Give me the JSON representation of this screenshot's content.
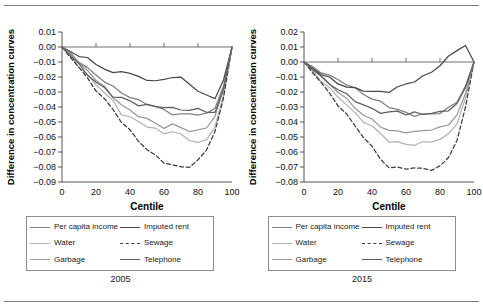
{
  "figure": {
    "rule_color": "#7d7d7d",
    "background": "#ffffff"
  },
  "panels": [
    {
      "year_label": "2005",
      "axis": {
        "xlabel": "Centile",
        "ylabel": "Difference in concentration curves",
        "xticks": [
          "0",
          "20",
          "40",
          "60",
          "80",
          "100"
        ],
        "yticks": [
          "0.01",
          "0.00",
          "−0.01",
          "−0.02",
          "−0.03",
          "−0.04",
          "−0.05",
          "−0.06",
          "−0.07",
          "−0.08",
          "−0.09"
        ]
      },
      "legend": [
        {
          "label": "Per capita income",
          "color": "#7f7f7f",
          "style": "solid"
        },
        {
          "label": "Imputed rent",
          "color": "#4a4a4a",
          "style": "solid"
        },
        {
          "label": "Water",
          "color": "#b3b3b3",
          "style": "solid"
        },
        {
          "label": "Sewage",
          "color": "#3d3d3d",
          "style": "dashed"
        },
        {
          "label": "Garbage",
          "color": "#999999",
          "style": "solid"
        },
        {
          "label": "Telephone",
          "color": "#5e5e5e",
          "style": "solid"
        }
      ]
    },
    {
      "year_label": "2015",
      "axis": {
        "xlabel": "Centile",
        "ylabel": "Difference in concentration curves",
        "xticks": [
          "0",
          "20",
          "40",
          "60",
          "80",
          "100"
        ],
        "yticks": [
          "0.02",
          "0.01",
          "0.00",
          "−0.01",
          "−0.02",
          "−0.03",
          "−0.04",
          "−0.05",
          "−0.06",
          "−0.07",
          "−0.08"
        ]
      },
      "legend": [
        {
          "label": "Per capita income",
          "color": "#7f7f7f",
          "style": "solid"
        },
        {
          "label": "Imputed rent",
          "color": "#4a4a4a",
          "style": "solid"
        },
        {
          "label": "Water",
          "color": "#b3b3b3",
          "style": "solid"
        },
        {
          "label": "Sewage",
          "color": "#3d3d3d",
          "style": "dashed"
        },
        {
          "label": "Garbage",
          "color": "#999999",
          "style": "solid"
        },
        {
          "label": "Telephone",
          "color": "#5e5e5e",
          "style": "solid"
        }
      ]
    }
  ],
  "chart_data": [
    {
      "type": "line",
      "title": "2005",
      "xlabel": "Centile",
      "ylabel": "Difference in concentration curves",
      "xlim": [
        0,
        100
      ],
      "ylim": [
        -0.09,
        0.01
      ],
      "yticks": [
        0.01,
        0.0,
        -0.01,
        -0.02,
        -0.03,
        -0.04,
        -0.05,
        -0.06,
        -0.07,
        -0.08,
        -0.09
      ],
      "xticks": [
        0,
        20,
        40,
        60,
        80,
        100
      ],
      "grid": false,
      "legend_position": "below",
      "x": [
        0,
        5,
        10,
        15,
        20,
        25,
        30,
        35,
        40,
        45,
        50,
        55,
        60,
        65,
        70,
        75,
        80,
        85,
        90,
        95,
        100
      ],
      "series": [
        {
          "name": "Per capita income",
          "color": "#7f7f7f",
          "style": "solid",
          "values": [
            0.0,
            -0.004,
            -0.009,
            -0.014,
            -0.019,
            -0.023,
            -0.027,
            -0.03,
            -0.033,
            -0.036,
            -0.038,
            -0.04,
            -0.042,
            -0.044,
            -0.045,
            -0.045,
            -0.045,
            -0.045,
            -0.04,
            -0.026,
            0.0
          ]
        },
        {
          "name": "Imputed rent",
          "color": "#4a4a4a",
          "style": "solid",
          "values": [
            0.0,
            -0.003,
            -0.006,
            -0.008,
            -0.011,
            -0.014,
            -0.018,
            -0.016,
            -0.018,
            -0.02,
            -0.021,
            -0.023,
            -0.022,
            -0.02,
            -0.021,
            -0.024,
            -0.029,
            -0.033,
            -0.034,
            -0.022,
            0.0
          ]
        },
        {
          "name": "Water",
          "color": "#b3b3b3",
          "style": "solid",
          "values": [
            0.0,
            -0.006,
            -0.013,
            -0.019,
            -0.025,
            -0.031,
            -0.036,
            -0.044,
            -0.047,
            -0.05,
            -0.053,
            -0.055,
            -0.057,
            -0.056,
            -0.059,
            -0.062,
            -0.064,
            -0.062,
            -0.052,
            -0.032,
            0.0
          ]
        },
        {
          "name": "Sewage",
          "color": "#3d3d3d",
          "style": "dashed",
          "values": [
            0.0,
            -0.007,
            -0.014,
            -0.021,
            -0.028,
            -0.035,
            -0.042,
            -0.05,
            -0.056,
            -0.062,
            -0.068,
            -0.073,
            -0.077,
            -0.079,
            -0.08,
            -0.079,
            -0.076,
            -0.069,
            -0.056,
            -0.034,
            0.0
          ]
        },
        {
          "name": "Garbage",
          "color": "#999999",
          "style": "solid",
          "values": [
            0.0,
            -0.005,
            -0.011,
            -0.016,
            -0.022,
            -0.027,
            -0.033,
            -0.038,
            -0.043,
            -0.046,
            -0.048,
            -0.051,
            -0.053,
            -0.052,
            -0.054,
            -0.056,
            -0.056,
            -0.053,
            -0.046,
            -0.028,
            0.0
          ]
        },
        {
          "name": "Telephone",
          "color": "#5e5e5e",
          "style": "solid",
          "values": [
            0.0,
            -0.006,
            -0.012,
            -0.018,
            -0.023,
            -0.028,
            -0.033,
            -0.034,
            -0.036,
            -0.038,
            -0.039,
            -0.04,
            -0.04,
            -0.041,
            -0.041,
            -0.042,
            -0.042,
            -0.043,
            -0.044,
            -0.028,
            0.0
          ]
        }
      ]
    },
    {
      "type": "line",
      "title": "2015",
      "xlabel": "Centile",
      "ylabel": "Difference in concentration curves",
      "xlim": [
        0,
        100
      ],
      "ylim": [
        -0.08,
        0.02
      ],
      "yticks": [
        0.02,
        0.01,
        0.0,
        -0.01,
        -0.02,
        -0.03,
        -0.04,
        -0.05,
        -0.06,
        -0.07,
        -0.08
      ],
      "xticks": [
        0,
        20,
        40,
        60,
        80,
        100
      ],
      "grid": false,
      "legend_position": "below",
      "x": [
        0,
        5,
        10,
        15,
        20,
        25,
        30,
        35,
        40,
        45,
        50,
        55,
        60,
        65,
        70,
        75,
        80,
        85,
        90,
        95,
        100
      ],
      "series": [
        {
          "name": "Per capita income",
          "color": "#7f7f7f",
          "style": "solid",
          "values": [
            0.0,
            -0.003,
            -0.006,
            -0.009,
            -0.012,
            -0.015,
            -0.018,
            -0.021,
            -0.024,
            -0.027,
            -0.03,
            -0.032,
            -0.034,
            -0.035,
            -0.035,
            -0.035,
            -0.034,
            -0.031,
            -0.026,
            -0.016,
            0.0
          ]
        },
        {
          "name": "Imputed rent",
          "color": "#4a4a4a",
          "style": "solid",
          "values": [
            0.0,
            -0.004,
            -0.008,
            -0.011,
            -0.014,
            -0.016,
            -0.018,
            -0.019,
            -0.02,
            -0.02,
            -0.019,
            -0.017,
            -0.015,
            -0.013,
            -0.01,
            -0.006,
            -0.002,
            0.003,
            0.008,
            0.011,
            0.0
          ]
        },
        {
          "name": "Water",
          "color": "#b3b3b3",
          "style": "solid",
          "values": [
            0.0,
            -0.006,
            -0.012,
            -0.018,
            -0.023,
            -0.029,
            -0.034,
            -0.039,
            -0.043,
            -0.048,
            -0.053,
            -0.054,
            -0.054,
            -0.055,
            -0.054,
            -0.053,
            -0.052,
            -0.048,
            -0.04,
            -0.024,
            0.0
          ]
        },
        {
          "name": "Sewage",
          "color": "#3d3d3d",
          "style": "dashed",
          "values": [
            0.0,
            -0.007,
            -0.014,
            -0.021,
            -0.028,
            -0.035,
            -0.043,
            -0.05,
            -0.057,
            -0.064,
            -0.07,
            -0.071,
            -0.071,
            -0.071,
            -0.071,
            -0.071,
            -0.07,
            -0.064,
            -0.052,
            -0.03,
            0.0
          ]
        },
        {
          "name": "Garbage",
          "color": "#999999",
          "style": "solid",
          "values": [
            0.0,
            -0.005,
            -0.01,
            -0.015,
            -0.02,
            -0.025,
            -0.03,
            -0.035,
            -0.039,
            -0.043,
            -0.046,
            -0.046,
            -0.046,
            -0.047,
            -0.046,
            -0.045,
            -0.044,
            -0.041,
            -0.035,
            -0.021,
            0.0
          ]
        },
        {
          "name": "Telephone",
          "color": "#5e5e5e",
          "style": "solid",
          "values": [
            0.0,
            -0.005,
            -0.01,
            -0.014,
            -0.018,
            -0.022,
            -0.026,
            -0.029,
            -0.031,
            -0.033,
            -0.034,
            -0.033,
            -0.035,
            -0.034,
            -0.034,
            -0.034,
            -0.034,
            -0.032,
            -0.028,
            -0.017,
            0.0
          ]
        }
      ]
    }
  ]
}
